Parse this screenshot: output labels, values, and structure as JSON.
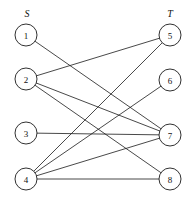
{
  "diagram": {
    "type": "bipartite-graph",
    "width": 192,
    "height": 210,
    "background_color": "#ffffff",
    "line_color": "#1a1a1a",
    "node_fill_color": "#ffffff",
    "node_radius": 11,
    "set_labels": [
      {
        "id": "S",
        "text": "S",
        "x": 27,
        "y": 13
      },
      {
        "id": "T",
        "text": "T",
        "x": 170,
        "y": 13
      }
    ],
    "nodes": [
      {
        "id": "1",
        "label": "1",
        "x": 26,
        "y": 35,
        "side": "left"
      },
      {
        "id": "2",
        "label": "2",
        "x": 26,
        "y": 79,
        "side": "left"
      },
      {
        "id": "3",
        "label": "3",
        "x": 26,
        "y": 133,
        "side": "left"
      },
      {
        "id": "4",
        "label": "4",
        "x": 26,
        "y": 179,
        "side": "left"
      },
      {
        "id": "5",
        "label": "5",
        "x": 170,
        "y": 35,
        "side": "right"
      },
      {
        "id": "6",
        "label": "6",
        "x": 170,
        "y": 80,
        "side": "right"
      },
      {
        "id": "7",
        "label": "7",
        "x": 170,
        "y": 135,
        "side": "right"
      },
      {
        "id": "8",
        "label": "8",
        "x": 170,
        "y": 179,
        "side": "right"
      }
    ],
    "edges": [
      {
        "id": "e1",
        "from": "1",
        "to": "7"
      },
      {
        "id": "e2",
        "from": "2",
        "to": "5"
      },
      {
        "id": "e3",
        "from": "2",
        "to": "7"
      },
      {
        "id": "e4",
        "from": "2",
        "to": "8"
      },
      {
        "id": "e5",
        "from": "3",
        "to": "7"
      },
      {
        "id": "e6",
        "from": "4",
        "to": "5"
      },
      {
        "id": "e7",
        "from": "4",
        "to": "6"
      },
      {
        "id": "e8",
        "from": "4",
        "to": "7"
      },
      {
        "id": "e9",
        "from": "4",
        "to": "8"
      }
    ]
  }
}
